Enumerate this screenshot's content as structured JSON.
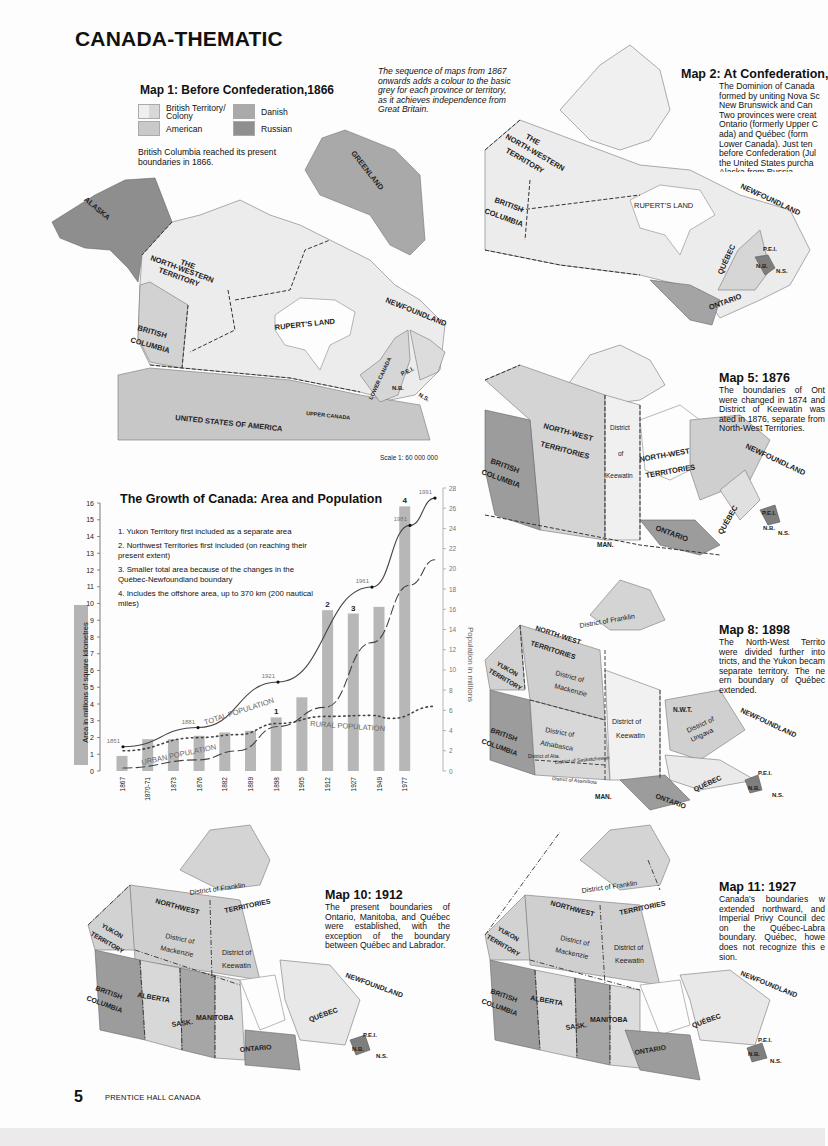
{
  "page": {
    "title": "CANADA-THEMATIC",
    "page_number": "5",
    "publisher": "PRENTICE HALL CANADA",
    "intro_note": "The sequence of maps from 1867 onwards adds a colour to the basic grey for each province or territory, as it achieves independence from Great Britain."
  },
  "colors": {
    "british": "#eeeeee",
    "british_alt": "#d6d6d6",
    "american": "#c7c7c7",
    "danish": "#a9a9a9",
    "russian": "#8e8e8e",
    "bar": "#b7b7b7",
    "ink": "#222222"
  },
  "map1": {
    "title": "Map 1: Before Confederation,1866",
    "legend": [
      {
        "label": "British Territory/ Colony",
        "swatch": "british"
      },
      {
        "label": "Danish",
        "swatch": "danish"
      },
      {
        "label": "American",
        "swatch": "american"
      },
      {
        "label": "Russian",
        "swatch": "russian"
      }
    ],
    "note": "British Columbia reached its present boundaries in 1866.",
    "labels": {
      "alaska": "ALASKA",
      "greenland": "GREENLAND",
      "the": "THE",
      "nw1": "NORTH-WESTERN",
      "nw2": "TERRITORY",
      "bc1": "BRITISH",
      "bc2": "COLUMBIA",
      "ruperts": "RUPERT'S LAND",
      "newfoundland": "NEWFOUNDLAND",
      "lower_canada": "LOWER CANADA",
      "upper_canada": "UPPER CANADA",
      "pei": "P.E.I.",
      "nb": "N.B.",
      "ns": "N.S.",
      "usa": "UNITED STATES OF AMERICA"
    },
    "scale": "Scale 1: 60 000 000"
  },
  "map2": {
    "title": "Map 2: At Confederation,",
    "description": "The Dominion of Canada formed by uniting Nova Sc New Brunswick and Can Two provinces were creat Ontario (formerly Upper C ada) and Québec (form Lower Canada). Just ten before Confederation (Jul the United States purcha Alaska from Russia.",
    "labels": {
      "the": "THE",
      "nw1": "NORTH-WESTERN",
      "nw2": "TERRITORY",
      "bc1": "BRITISH",
      "bc2": "COLUMBIA",
      "ruperts": "RUPERT'S LAND",
      "newfoundland": "NEWFOUNDLAND",
      "quebec": "QUÉBEC",
      "ontario": "ONTARIO",
      "pei": "P.E.I.",
      "nb": "N.B.",
      "ns": "N.S."
    }
  },
  "map5": {
    "title": "Map 5: 1876",
    "description": "The boundaries of Ont were changed in 1874 and District of Keewatin was ated in 1876, separate from North-West Territories.",
    "labels": {
      "nwt1": "NORTH-WEST",
      "nwt2": "TERRITORIES",
      "district": "District",
      "of": "of",
      "keewatin": "Keewatin",
      "nwt3": "NORTH-WEST",
      "nwt4": "TERRITORIES",
      "bc1": "BRITISH",
      "bc2": "COLUMBIA",
      "newfoundland": "NEWFOUNDLAND",
      "quebec": "QUÉBEC",
      "ontario": "ONTARIO",
      "man": "MAN.",
      "pei": "P.E.I.",
      "nb": "N.B.",
      "ns": "N.S."
    }
  },
  "map8": {
    "title": "Map 8: 1898",
    "description": "The North-West Territo were divided further into tricts, and the Yukon becam separate territory. The ne ern boundary of Québec extended.",
    "labels": {
      "franklin": "District of Franklin",
      "nwt1": "NORTH-WEST",
      "nwt2": "TERRITORIES",
      "yukon1": "YUKON",
      "yukon2": "TERRITORY",
      "mack1": "District of",
      "mack2": "Mackenzie",
      "keew1": "District of",
      "keew2": "Keewatin",
      "nwt_abbr": "N.W.T.",
      "ung1": "District of",
      "ung2": "Ungava",
      "ath1": "District of",
      "ath2": "Athabasca",
      "alta": "District of Alta.",
      "sask": "District of Saskatchewan",
      "assin": "District of Assiniboia",
      "bc1": "BRITISH",
      "bc2": "COLUMBIA",
      "man": "MAN.",
      "newfoundland": "NEWFOUNDLAND",
      "quebec": "QUÉBEC",
      "ontario": "ONTARIO",
      "pei": "P.E.I.",
      "nb": "N.B.",
      "ns": "N.S."
    }
  },
  "map10": {
    "title": "Map 10: 1912",
    "description": "The present boundaries of Ontario, Manitoba, and Québec were established, with the exception of the boundary between Québec and Labrador.",
    "labels": {
      "franklin": "District of Franklin",
      "nw": "NORTHWEST",
      "terr": "TERRITORIES",
      "yukon1": "YUKON",
      "yukon2": "TERRITORY",
      "mack1": "District of",
      "mack2": "Mackenzie",
      "keew1": "District of",
      "keew2": "Keewatin",
      "bc1": "BRITISH",
      "bc2": "COLUMBIA",
      "alberta": "ALBERTA",
      "sask": "SASK.",
      "manitoba": "MANITOBA",
      "ontario": "ONTARIO",
      "quebec": "QUÉBEC",
      "newfoundland": "NEWFOUNDLAND",
      "pei": "P.E.I.",
      "nb": "N.B.",
      "ns": "N.S."
    }
  },
  "map11": {
    "title": "Map 11: 1927",
    "description": "Canada's boundaries w extended northward, and Imperial Privy Council dec on the Québec-Labra boundary. Québec, howe does not recognize this e sion.",
    "labels": {
      "franklin": "District of Franklin",
      "nw": "NORTHWEST",
      "terr": "TERRITORIES",
      "yukon1": "YUKON",
      "yukon2": "TERRITORY",
      "mack1": "District of",
      "mack2": "Mackenzie",
      "keew1": "District of",
      "keew2": "Keewatin",
      "bc1": "BRITISH",
      "bc2": "COLUMBIA",
      "alberta": "ALBERTA",
      "sask": "SASK.",
      "manitoba": "MANITOBA",
      "ontario": "ONTARIO",
      "quebec": "QUÉBEC",
      "newfoundland": "NEWFOUNDLAND",
      "pei": "P.E.I.",
      "nb": "N.B.",
      "ns": "N.S."
    }
  },
  "chart_data": {
    "type": "bar",
    "title": "The Growth of Canada: Area and Population",
    "xlabel": "",
    "ylabel": "Area in millions of square kilometres",
    "y2label": "Population in millions",
    "ylim": [
      0,
      16
    ],
    "y2lim": [
      0,
      28
    ],
    "yticks": [
      "0",
      "1",
      "2",
      "3",
      "4",
      "5",
      "6",
      "7",
      "8",
      "9",
      "10",
      "11",
      "12",
      "13",
      "14",
      "15",
      "16"
    ],
    "y2ticks": [
      "0",
      "2",
      "4",
      "6",
      "8",
      "10",
      "12",
      "14",
      "16",
      "18",
      "20",
      "22",
      "24",
      "26",
      "28"
    ],
    "categories": [
      "1867",
      "1870-71",
      "1873",
      "1876",
      "1882",
      "1889",
      "1898",
      "1905",
      "1912",
      "1927",
      "1949",
      "1977"
    ],
    "values": [
      0.9,
      1.9,
      1.9,
      2.1,
      2.3,
      2.4,
      3.2,
      4.4,
      9.6,
      9.4,
      9.8,
      15.8
    ],
    "bar_annotations": [
      {
        "category": "1898",
        "label": "1"
      },
      {
        "category": "1912",
        "label": "2"
      },
      {
        "category": "1927",
        "label": "3"
      },
      {
        "category": "1977",
        "label": "4"
      }
    ],
    "notes": [
      "1. Yukon Territory first included as a separate area",
      "2. Northwest Territories first included (on reaching their present extent)",
      "3. Smaller total area because of the changes in the Québec-Newfoundland boundary",
      "4. Includes the offshore area, up to 370 km (200 nautical miles)"
    ],
    "series": [
      {
        "name": "TOTAL POPULATION",
        "style": "solid",
        "axis": "right",
        "points": [
          [
            "1851",
            2.4
          ],
          [
            "1881",
            4.3
          ],
          [
            "1921",
            8.8
          ],
          [
            "1961",
            18.2
          ],
          [
            "1981",
            24.3
          ],
          [
            "1991",
            27.0
          ]
        ]
      },
      {
        "name": "URBAN POPULATION",
        "style": "dashed",
        "axis": "right",
        "points": [
          [
            "1851",
            0.3
          ],
          [
            "1881",
            1.1
          ],
          [
            "1901",
            2.0
          ],
          [
            "1921",
            4.4
          ],
          [
            "1941",
            6.3
          ],
          [
            "1961",
            12.7
          ],
          [
            "1981",
            18.4
          ],
          [
            "1991",
            20.9
          ]
        ]
      },
      {
        "name": "RURAL POPULATION",
        "style": "dotted",
        "axis": "right",
        "points": [
          [
            "1851",
            2.0
          ],
          [
            "1881",
            3.3
          ],
          [
            "1901",
            3.6
          ],
          [
            "1921",
            4.7
          ],
          [
            "1941",
            5.4
          ],
          [
            "1961",
            5.5
          ],
          [
            "1971",
            5.2
          ],
          [
            "1991",
            6.4
          ]
        ]
      }
    ],
    "point_labels": [
      "1851",
      "1881",
      "1921",
      "1961",
      "1981",
      "1991"
    ],
    "grid": false,
    "legend": "inline labels"
  }
}
